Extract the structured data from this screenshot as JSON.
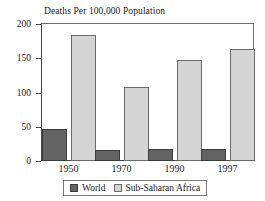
{
  "chart_data": {
    "type": "bar",
    "title": "Deaths Per 100,000 Population",
    "xlabel": "",
    "ylabel": "",
    "categories": [
      "1950",
      "1970",
      "1990",
      "1997"
    ],
    "series": [
      {
        "name": "World",
        "color": "#636363",
        "values": [
          47,
          16,
          17,
          17
        ]
      },
      {
        "name": "Sub-Saharan Africa",
        "color": "#d4d4d4",
        "values": [
          184,
          108,
          148,
          163
        ]
      }
    ],
    "ylim": [
      0,
      200
    ],
    "yticks": [
      0,
      50,
      100,
      150,
      200
    ],
    "ytick_labels": [
      "0",
      "50",
      "100",
      "150",
      "200"
    ],
    "grid": false,
    "legend_position": "bottom"
  },
  "legend": {
    "entries": [
      {
        "label": "World",
        "swatch": "dark-gray-swatch"
      },
      {
        "label": "Sub-Saharan Africa",
        "swatch": "light-gray-swatch"
      }
    ]
  }
}
